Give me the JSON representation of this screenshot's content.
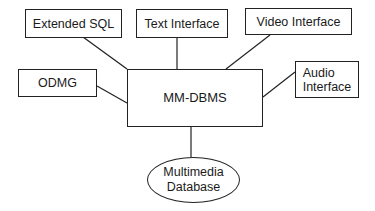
{
  "diagram": {
    "center": {
      "label": "MM-DBMS"
    },
    "nodes": [
      {
        "id": "extended-sql",
        "label": "Extended SQL"
      },
      {
        "id": "text-interface",
        "label": "Text Interface"
      },
      {
        "id": "video-interface",
        "label": "Video Interface"
      },
      {
        "id": "odmg",
        "label": "ODMG"
      },
      {
        "id": "audio-interface",
        "lines": [
          "Audio",
          "Interface"
        ]
      }
    ],
    "database": {
      "lines": [
        "Multimedia",
        "Database"
      ]
    },
    "edges": [
      [
        "extended-sql",
        "MM-DBMS"
      ],
      [
        "text-interface",
        "MM-DBMS"
      ],
      [
        "video-interface",
        "MM-DBMS"
      ],
      [
        "odmg",
        "MM-DBMS"
      ],
      [
        "audio-interface",
        "MM-DBMS"
      ],
      [
        "MM-DBMS",
        "multimedia-database"
      ]
    ]
  }
}
